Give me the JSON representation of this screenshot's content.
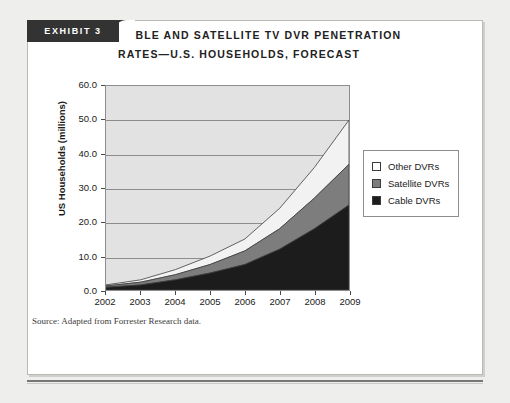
{
  "exhibit": {
    "label": "EXHIBIT 3"
  },
  "title": {
    "line1": "CABLE AND SATELLITE TV DVR PENETRATION",
    "line2": "RATES—U.S. HOUSEHOLDS, FORECAST"
  },
  "source": {
    "text": "Source: Adapted from Forrester Research data."
  },
  "legend": {
    "items": [
      {
        "label": "Other DVRs",
        "color": "#ffffff"
      },
      {
        "label": "Satellite DVRs",
        "color": "#7d7d7d"
      },
      {
        "label": "Cable DVRs",
        "color": "#1c1c1c"
      }
    ]
  },
  "axis": {
    "y_ticks": [
      "60.0",
      "50.0",
      "40.0",
      "30.0",
      "20.0",
      "10.0",
      "0.0"
    ],
    "x_ticks": [
      "2002",
      "2003",
      "2004",
      "2005",
      "2006",
      "2007",
      "2008",
      "2009"
    ],
    "ylabel": "US Households (millions)"
  },
  "chart_data": {
    "type": "area",
    "stacked": true,
    "title": "CABLE AND SATELLITE TV DVR PENETRATION RATES—U.S. HOUSEHOLDS, FORECAST",
    "xlabel": "",
    "ylabel": "US Households (millions)",
    "categories": [
      2002,
      2003,
      2004,
      2005,
      2006,
      2007,
      2008,
      2009
    ],
    "ylim": [
      0,
      60
    ],
    "ytick_step": 10,
    "grid": true,
    "legend_position": "right",
    "plot_background": "#e2e2e2",
    "series": [
      {
        "name": "Cable DVRs",
        "color": "#1c1c1c",
        "values": [
          0.8,
          1.5,
          3.0,
          5.0,
          7.5,
          12.0,
          18.0,
          25.0
        ]
      },
      {
        "name": "Satellite DVRs",
        "color": "#7d7d7d",
        "values": [
          0.4,
          0.8,
          1.5,
          2.5,
          4.0,
          6.0,
          9.0,
          12.0
        ]
      },
      {
        "name": "Other DVRs",
        "color": "#f2f2f2",
        "values": [
          0.3,
          0.7,
          1.5,
          2.5,
          3.5,
          6.0,
          9.0,
          13.0
        ]
      }
    ],
    "totals": [
      1.5,
      3.0,
      6.0,
      10.0,
      15.0,
      24.0,
      36.0,
      50.0
    ]
  }
}
